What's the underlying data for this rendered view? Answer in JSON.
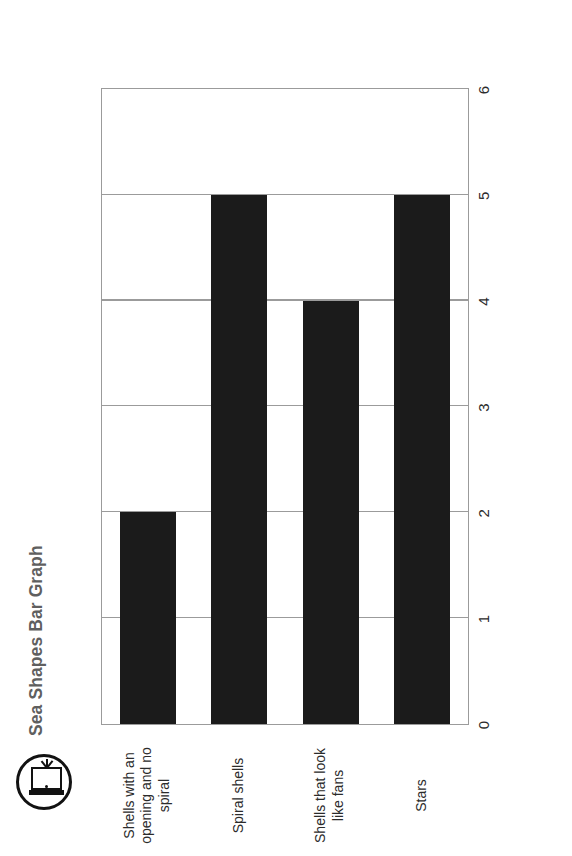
{
  "page": {
    "orientation_note_hidden": true
  },
  "header": {
    "logo_icon": "door-exit-icon",
    "title": "Sea Shapes Bar Graph",
    "title_color": "#5f5f5f"
  },
  "chart_data": {
    "type": "bar",
    "orientation": "horizontal",
    "title": "Sea Shapes Bar Graph",
    "xlabel": "",
    "ylabel": "",
    "categories": [
      "Stars",
      "Shells that look like fans",
      "Spiral shells",
      "Shells with an opening and no spiral"
    ],
    "category_label_lines": [
      [
        "Stars"
      ],
      [
        "Shells that look",
        "like fans"
      ],
      [
        "Spiral shells"
      ],
      [
        "Shells with an",
        "opening and no",
        "spiral"
      ]
    ],
    "values": [
      5,
      4,
      5,
      2
    ],
    "value_axis_ticks": [
      0,
      1,
      2,
      3,
      4,
      5,
      6
    ],
    "value_axis_ticks_display_order": [
      6,
      5,
      4,
      3,
      2,
      1,
      0
    ],
    "xlim": [
      0,
      6
    ],
    "grid": true,
    "gridlines_at": [
      1,
      2,
      3,
      4,
      5
    ],
    "legend": null,
    "bar_color": "#1b1b1b",
    "axis_color": "#9b9b9b",
    "tick_label_color": "#2b2b2b"
  }
}
